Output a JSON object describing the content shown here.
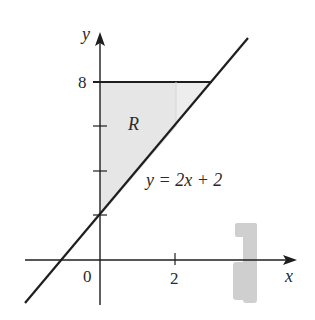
{
  "figure": {
    "type": "region-diagram",
    "axes": {
      "x_label": "x",
      "y_label": "y",
      "origin_label": "0",
      "x_tick_labels": [
        "2"
      ],
      "y_tick_labels": [
        "8"
      ],
      "y_unlabeled_ticks": [
        2,
        4,
        6
      ]
    },
    "curves": [
      {
        "name": "line",
        "equation_label": "y = 2x + 2",
        "slope": 2,
        "intercept": 2
      },
      {
        "name": "top-boundary",
        "equation": "y = 8",
        "x_range": [
          0,
          3
        ]
      }
    ],
    "region": {
      "label": "R",
      "bounded_by": [
        "x = 0",
        "y = 8",
        "y = 2x + 2"
      ],
      "fill": "#ececec",
      "strip_fill": "#e4e4e4",
      "strip_x_range": [
        0,
        2
      ]
    },
    "colors": {
      "stroke": "#1e1e1e",
      "region_fill": "#ececec",
      "rotation_icon": "#c8c8c8"
    },
    "icons": [
      "rotation-arrow-icon"
    ]
  }
}
